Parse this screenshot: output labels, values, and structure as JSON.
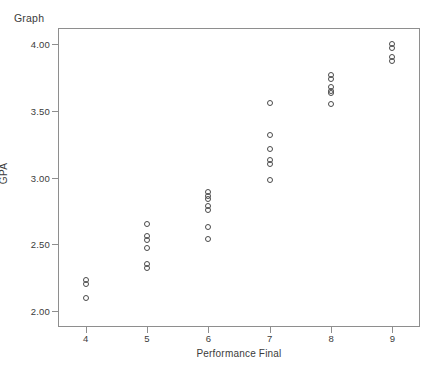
{
  "chart_data": {
    "type": "scatter",
    "title": "Graph",
    "xlabel": "Performance Final",
    "ylabel": "GPA",
    "xlim": [
      3.55,
      9.45
    ],
    "ylim": [
      1.88,
      4.12
    ],
    "xticks": [
      4,
      5,
      6,
      7,
      8,
      9
    ],
    "xtick_labels": [
      "4",
      "5",
      "6",
      "7",
      "8",
      "9"
    ],
    "yticks": [
      2.0,
      2.5,
      3.0,
      3.5,
      4.0
    ],
    "ytick_labels": [
      "2.00",
      "2.50",
      "3.00",
      "3.50",
      "4.00"
    ],
    "grid": false,
    "legend": null,
    "marker": "open-circle",
    "marker_color": "#4a4a4a",
    "frame_color": "#8e8e8e",
    "points": [
      {
        "x": 4,
        "y": 2.23
      },
      {
        "x": 4,
        "y": 2.2
      },
      {
        "x": 4,
        "y": 2.1
      },
      {
        "x": 5,
        "y": 2.65
      },
      {
        "x": 5,
        "y": 2.56
      },
      {
        "x": 5,
        "y": 2.53
      },
      {
        "x": 5,
        "y": 2.47
      },
      {
        "x": 5,
        "y": 2.35
      },
      {
        "x": 5,
        "y": 2.32
      },
      {
        "x": 6,
        "y": 2.89
      },
      {
        "x": 6,
        "y": 2.86
      },
      {
        "x": 6,
        "y": 2.84
      },
      {
        "x": 6,
        "y": 2.79
      },
      {
        "x": 6,
        "y": 2.76
      },
      {
        "x": 6,
        "y": 2.63
      },
      {
        "x": 6,
        "y": 2.54
      },
      {
        "x": 7,
        "y": 3.56
      },
      {
        "x": 7,
        "y": 3.32
      },
      {
        "x": 7,
        "y": 3.21
      },
      {
        "x": 7,
        "y": 3.13
      },
      {
        "x": 7,
        "y": 3.1
      },
      {
        "x": 7,
        "y": 2.98
      },
      {
        "x": 8,
        "y": 3.77
      },
      {
        "x": 8,
        "y": 3.74
      },
      {
        "x": 8,
        "y": 3.68
      },
      {
        "x": 8,
        "y": 3.65
      },
      {
        "x": 8,
        "y": 3.63
      },
      {
        "x": 8,
        "y": 3.55
      },
      {
        "x": 9,
        "y": 4.0
      },
      {
        "x": 9,
        "y": 3.97
      },
      {
        "x": 9,
        "y": 3.9
      },
      {
        "x": 9,
        "y": 3.87
      }
    ]
  }
}
